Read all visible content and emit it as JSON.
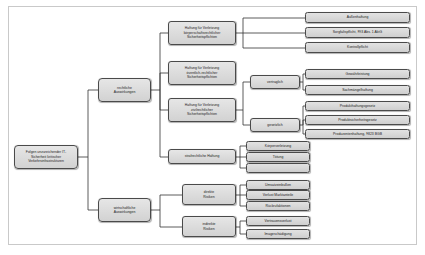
{
  "diagram": {
    "background_color": "#ffffff",
    "frame_color": "#c9c9c9",
    "node_fill_color": "#dcdcdc",
    "node_border_color": "#4a4a4a",
    "connector_color": "#333333",
    "nodes": {
      "root": "Folgen unzureichender IT-\nSicherheit kritischer\nVerkehrsinfrastrukturen",
      "rechtliche": "rechtliche\nAuswirkungen",
      "wirtschaftliche": "wirtschaftliche\nAuswirkungen",
      "haftung_koerperschaft": "Haftung für Verletzung\nkörperschaftsrechtlicher\nSicherheitspflichten",
      "haftung_oeffentlich": "Haftung für Verletzung\növentlich-rechtlicher\nSicherheitspflichten",
      "haftung_zivil": "Haftung für Verletzung\nzivilrechtlicher\nSicherheitspflichten",
      "strafrechtliche": "strafrechtliche Haftung",
      "aussenhaftung": "Außenhaftung",
      "sorgfaltspflicht": "Sorgfaltspflicht, §93 Abs. 1 AktG",
      "kontrollpflicht": "Kontrollpflicht",
      "vertraglich": "vertraglich",
      "gesetzlich": "gesetzlich",
      "gewaehrleistung": "Gewährleistung",
      "sachmaengelhaftung": "Sachmängelhaftung",
      "produkthaftungsgesetz": "Produkthaftungsgesetz",
      "produktsicherheitsgesetz": "Produktsicherheitsgesetz",
      "produzentenhaftung": "Produzentenhaftung, §823 BGB",
      "koerperverletzung": "Körperverletzung",
      "toetung": "Tötung",
      "strafrecht_leer": "",
      "direkte_risiken": "direkte\nRisiken",
      "indirekte_risiken": "indirekte\nRisiken",
      "umsatzeinbussen": "Umsatzeinbußen",
      "verlust_marktanteile": "Verlust Marktanteile",
      "rueckrufaktionen": "Rückrufaktionen",
      "vertrauensverlust": "Vertrauensverlust",
      "imageschaedigung": "Imageschädigung"
    }
  }
}
